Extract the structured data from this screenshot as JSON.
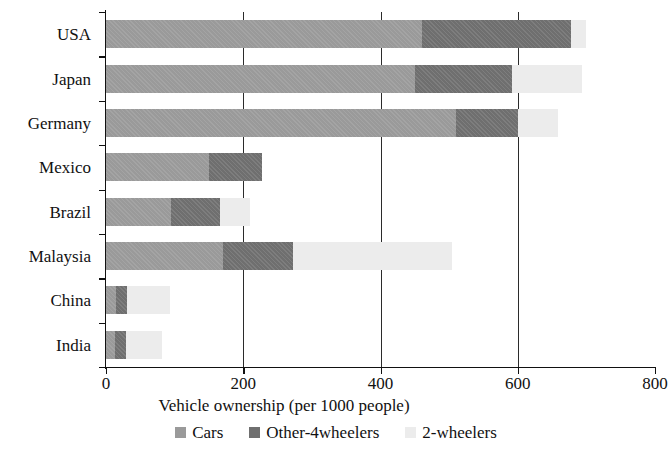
{
  "chart_data": {
    "type": "bar",
    "orientation": "horizontal",
    "stacked": true,
    "title": "",
    "xlabel": "Vehicle ownership (per 1000 people)",
    "ylabel": "",
    "xlim": [
      0,
      800
    ],
    "xticks": [
      0,
      200,
      400,
      600,
      800
    ],
    "xtick_labels": [
      "0",
      "200",
      "400",
      "600",
      "800"
    ],
    "grid": "vertical",
    "legend_position": "bottom",
    "categories": [
      "USA",
      "Japan",
      "Germany",
      "Mexico",
      "Brazil",
      "Malaysia",
      "China",
      "India"
    ],
    "series": [
      {
        "name": "Cars",
        "color": "#9a9a9a",
        "values": [
          460,
          450,
          510,
          150,
          95,
          170,
          15,
          13
        ]
      },
      {
        "name": "Other-4wheelers",
        "color": "#6f6f6f",
        "values": [
          218,
          142,
          90,
          77,
          71,
          103,
          16,
          16
        ]
      },
      {
        "name": "2-wheelers",
        "color": "#ececec",
        "values": [
          22,
          102,
          59,
          0,
          44,
          231,
          62,
          53
        ]
      }
    ],
    "totals": [
      700,
      694,
      659,
      227,
      210,
      504,
      93,
      82
    ]
  },
  "legend": {
    "items": [
      {
        "label": "Cars",
        "swatch": "legend-swatch-cars"
      },
      {
        "label": "Other-4wheelers",
        "swatch": "legend-swatch-other-4wheelers"
      },
      {
        "label": "2-wheelers",
        "swatch": "legend-swatch-2-wheelers"
      }
    ]
  },
  "axis": {
    "x_title": "Vehicle ownership (per 1000 people)"
  }
}
